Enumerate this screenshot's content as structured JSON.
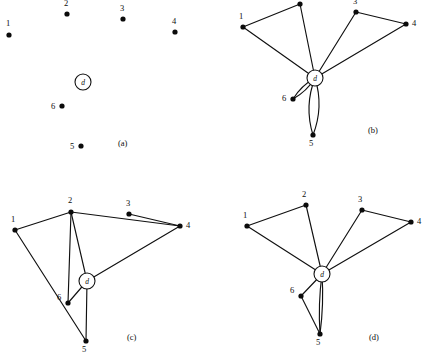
{
  "figure": {
    "width": 426,
    "height": 364,
    "background": "#ffffff",
    "ink_color": "#101010",
    "depot_label": "d",
    "customer_labels": [
      "1",
      "2",
      "3",
      "4",
      "5",
      "6"
    ]
  },
  "panels": [
    {
      "id": "a",
      "caption": "(a)",
      "caption_pos": [
        118,
        146
      ],
      "depot": {
        "label": "d",
        "x": 83,
        "y": 82,
        "r": 8
      },
      "nodes": [
        {
          "label": "1",
          "x": 9,
          "y": 35,
          "lx": 6,
          "ly": 26
        },
        {
          "label": "2",
          "x": 67,
          "y": 14,
          "lx": 64,
          "ly": 6
        },
        {
          "label": "3",
          "x": 123,
          "y": 19,
          "lx": 120,
          "ly": 11
        },
        {
          "label": "4",
          "x": 175,
          "y": 32,
          "lx": 172,
          "ly": 24
        },
        {
          "label": "5",
          "x": 81,
          "y": 146,
          "lx": 70,
          "ly": 149
        },
        {
          "label": "6",
          "x": 62,
          "y": 106,
          "lx": 51,
          "ly": 109
        }
      ],
      "edges": []
    },
    {
      "id": "b",
      "caption": "(b)",
      "caption_pos": [
        368,
        133
      ],
      "depot": {
        "label": "d",
        "x": 315,
        "y": 78,
        "r": 8
      },
      "nodes": [
        {
          "label": "1",
          "x": 243,
          "y": 27,
          "lx": 239,
          "ly": 19
        },
        {
          "label": "2",
          "x": 300,
          "y": 4,
          "lx": 297,
          "ly": -4
        },
        {
          "label": "3",
          "x": 356,
          "y": 12,
          "lx": 353,
          "ly": 4
        },
        {
          "label": "4",
          "x": 406,
          "y": 24,
          "lx": 412,
          "ly": 26
        },
        {
          "label": "5",
          "x": 313,
          "y": 135,
          "lx": 309,
          "ly": 146
        },
        {
          "label": "6",
          "x": 293,
          "y": 99,
          "lx": 282,
          "ly": 101
        }
      ],
      "edges": [
        {
          "from": "1",
          "to": "2",
          "curve": 0
        },
        {
          "from": "1",
          "to": "d",
          "curve": 0
        },
        {
          "from": "2",
          "to": "d",
          "curve": 0
        },
        {
          "from": "3",
          "to": "4",
          "curve": 0
        },
        {
          "from": "3",
          "to": "d",
          "curve": 0
        },
        {
          "from": "4",
          "to": "d",
          "curve": 0
        },
        {
          "from": "d",
          "to": "5",
          "curve": 5
        },
        {
          "from": "d",
          "to": "5",
          "curve": -5
        },
        {
          "from": "d",
          "to": "6",
          "curve": 2
        },
        {
          "from": "d",
          "to": "6",
          "curve": -2
        }
      ]
    },
    {
      "id": "c",
      "caption": "(c)",
      "caption_pos": [
        127,
        340
      ],
      "depot": {
        "label": "d",
        "x": 87,
        "y": 281,
        "r": 8
      },
      "nodes": [
        {
          "label": "1",
          "x": 15,
          "y": 230,
          "lx": 11,
          "ly": 222
        },
        {
          "label": "2",
          "x": 71,
          "y": 212,
          "lx": 68,
          "ly": 203
        },
        {
          "label": "3",
          "x": 129,
          "y": 214,
          "lx": 126,
          "ly": 206
        },
        {
          "label": "4",
          "x": 180,
          "y": 226,
          "lx": 186,
          "ly": 228
        },
        {
          "label": "5",
          "x": 86,
          "y": 341,
          "lx": 82,
          "ly": 352
        },
        {
          "label": "6",
          "x": 68,
          "y": 303,
          "lx": 57,
          "ly": 300
        }
      ],
      "edges": [
        {
          "from": "1",
          "to": "2",
          "curve": 0
        },
        {
          "from": "1",
          "to": "5",
          "curve": 0
        },
        {
          "from": "2",
          "to": "4",
          "curve": 0
        },
        {
          "from": "2",
          "to": "6",
          "curve": 0
        },
        {
          "from": "2",
          "to": "d",
          "curve": 0
        },
        {
          "from": "3",
          "to": "4",
          "curve": 0
        },
        {
          "from": "4",
          "to": "d",
          "curve": 0
        },
        {
          "from": "d",
          "to": "6",
          "curve": 0
        },
        {
          "from": "d",
          "to": "5",
          "curve": 0
        }
      ]
    },
    {
      "id": "d",
      "caption": "(d)",
      "caption_pos": [
        369,
        340
      ],
      "depot": {
        "label": "d",
        "x": 322,
        "y": 274,
        "r": 8
      },
      "nodes": [
        {
          "label": "1",
          "x": 247,
          "y": 226,
          "lx": 243,
          "ly": 218
        },
        {
          "label": "2",
          "x": 306,
          "y": 205,
          "lx": 302,
          "ly": 197
        },
        {
          "label": "3",
          "x": 362,
          "y": 210,
          "lx": 358,
          "ly": 202
        },
        {
          "label": "4",
          "x": 411,
          "y": 222,
          "lx": 417,
          "ly": 224
        },
        {
          "label": "5",
          "x": 320,
          "y": 334,
          "lx": 316,
          "ly": 345
        },
        {
          "label": "6",
          "x": 301,
          "y": 296,
          "lx": 290,
          "ly": 293
        }
      ],
      "edges": [
        {
          "from": "1",
          "to": "2",
          "curve": 0
        },
        {
          "from": "1",
          "to": "d",
          "curve": 0
        },
        {
          "from": "2",
          "to": "d",
          "curve": 0
        },
        {
          "from": "3",
          "to": "4",
          "curve": 0
        },
        {
          "from": "3",
          "to": "d",
          "curve": 0
        },
        {
          "from": "4",
          "to": "d",
          "curve": 0
        },
        {
          "from": "d",
          "to": "6",
          "curve": 0
        },
        {
          "from": "6",
          "to": "5",
          "curve": 0
        },
        {
          "from": "d",
          "to": "5",
          "curve": 1.5
        },
        {
          "from": "d",
          "to": "5",
          "curve": -1.5
        }
      ]
    }
  ]
}
